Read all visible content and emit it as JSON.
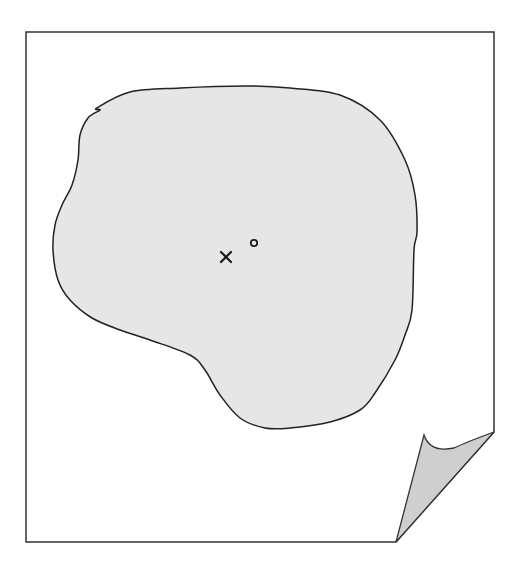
{
  "diagram": {
    "type": "page-with-curled-corner-and-region",
    "colors": {
      "background": "#ffffff",
      "stroke": "#333333",
      "region_fill": "#e6e6e6",
      "curl_fill": "#cfcfcf",
      "marker": "#1a1a1a"
    },
    "page": {
      "frame_left": 26,
      "frame_top": 32,
      "frame_right": 494,
      "frame_bottom": 542,
      "curl": {
        "base_left": [
          396,
          542
        ],
        "tip": [
          424,
          435
        ],
        "corner_right": [
          494,
          432
        ]
      }
    },
    "region": {
      "label": "",
      "outline_points": [
        [
          97,
          108
        ],
        [
          130,
          92
        ],
        [
          180,
          88
        ],
        [
          245,
          86
        ],
        [
          290,
          88
        ],
        [
          340,
          95
        ],
        [
          380,
          120
        ],
        [
          405,
          160
        ],
        [
          415,
          195
        ],
        [
          417,
          232
        ],
        [
          414,
          250
        ],
        [
          412,
          310
        ],
        [
          405,
          335
        ],
        [
          395,
          360
        ],
        [
          375,
          393
        ],
        [
          360,
          410
        ],
        [
          330,
          422
        ],
        [
          290,
          428
        ],
        [
          265,
          428
        ],
        [
          240,
          418
        ],
        [
          220,
          395
        ],
        [
          205,
          370
        ],
        [
          190,
          355
        ],
        [
          150,
          340
        ],
        [
          120,
          330
        ],
        [
          92,
          318
        ],
        [
          70,
          300
        ],
        [
          58,
          280
        ],
        [
          53,
          250
        ],
        [
          55,
          225
        ],
        [
          62,
          205
        ],
        [
          72,
          185
        ],
        [
          78,
          160
        ],
        [
          80,
          135
        ],
        [
          88,
          118
        ],
        [
          100,
          110
        ]
      ]
    },
    "markers": [
      {
        "id": "cross-marker",
        "glyph": "×",
        "x": 226,
        "y": 257
      },
      {
        "id": "circle-marker",
        "glyph": "o",
        "x": 254,
        "y": 243
      }
    ]
  }
}
